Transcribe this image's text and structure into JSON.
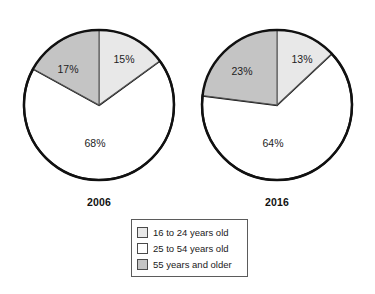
{
  "chart_data": [
    {
      "type": "pie",
      "title": "2006",
      "categories": [
        "16 to 24 years old",
        "25 to 54 years old",
        "55 years and older"
      ],
      "values": [
        15,
        68,
        17
      ],
      "labels": [
        "15%",
        "68%",
        "17%"
      ],
      "colors": [
        "#e8e8e8",
        "#ffffff",
        "#c4c4c4"
      ],
      "legend_position": "bottom-center",
      "grid": false
    },
    {
      "type": "pie",
      "title": "2016",
      "categories": [
        "16 to 24 years old",
        "25 to 54 years old",
        "55 years and older"
      ],
      "values": [
        13,
        64,
        23
      ],
      "labels": [
        "13%",
        "64%",
        "23%"
      ],
      "colors": [
        "#e8e8e8",
        "#ffffff",
        "#c4c4c4"
      ],
      "legend_position": "bottom-center",
      "grid": false
    }
  ],
  "charts": {
    "left": {
      "year": "2006",
      "slices": {
        "young": "15%",
        "middle": "68%",
        "older": "17%"
      }
    },
    "right": {
      "year": "2016",
      "slices": {
        "young": "13%",
        "middle": "64%",
        "older": "23%"
      }
    }
  },
  "legend": {
    "items": [
      {
        "label": "16 to 24 years old",
        "color": "#e8e8e8"
      },
      {
        "label": "25 to 54 years old",
        "color": "#ffffff"
      },
      {
        "label": "55 years and older",
        "color": "#c4c4c4"
      }
    ]
  },
  "colors": {
    "light_gray": "#e8e8e8",
    "white": "#ffffff",
    "medium_gray": "#c4c4c4",
    "outline": "#111111",
    "legend_border": "#5b5b5b"
  }
}
